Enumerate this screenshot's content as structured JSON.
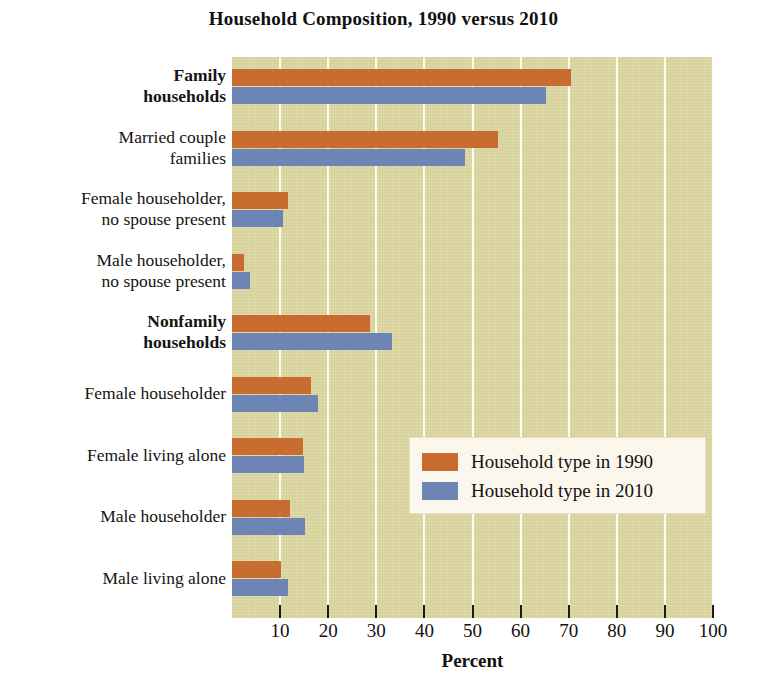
{
  "chart_data": {
    "type": "bar",
    "orientation": "horizontal",
    "title": "Household Composition, 1990 versus 2010",
    "xlabel": "Percent",
    "ylabel": "",
    "xlim": [
      0,
      100
    ],
    "xticks": [
      10,
      20,
      30,
      40,
      50,
      60,
      70,
      80,
      90,
      100
    ],
    "xtick_labels": [
      "10",
      "20",
      "30",
      "40",
      "50",
      "60",
      "70",
      "80",
      "90",
      "100"
    ],
    "grid": "vertical-white-gridlines",
    "legend_position": "center-right-inside",
    "plot_background": "#dbd5a0",
    "categories": [
      "Family\nhouseholds",
      "Married couple\nfamilies",
      "Female householder,\nno spouse present",
      "Male householder,\nno spouse present",
      "Nonfamily\nhouseholds",
      "Female householder",
      "Female living alone",
      "Male householder",
      "Male living alone"
    ],
    "category_emphasis": [
      true,
      false,
      false,
      false,
      true,
      false,
      false,
      false,
      false
    ],
    "series": [
      {
        "name": "Household type in 1990",
        "color": "#c96c30",
        "values": [
          70.5,
          55.4,
          11.6,
          2.5,
          28.6,
          16.4,
          14.7,
          12.0,
          10.2
        ]
      },
      {
        "name": "Household type in 2010",
        "color": "#6d85b5",
        "values": [
          65.2,
          48.5,
          10.6,
          3.7,
          33.2,
          17.8,
          15.0,
          15.1,
          11.6
        ]
      }
    ]
  },
  "legend": {
    "items": [
      {
        "label": "Household type in 1990",
        "swatch": "y1990"
      },
      {
        "label": "Household type in 2010",
        "swatch": "y2010"
      }
    ]
  }
}
